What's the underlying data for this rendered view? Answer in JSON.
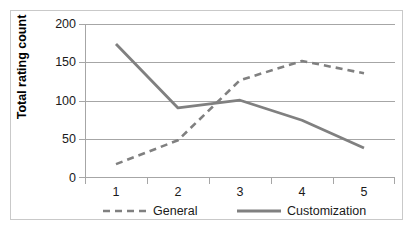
{
  "chart_data": {
    "type": "line",
    "title": "",
    "xlabel": "",
    "ylabel": "Total rating count",
    "categories": [
      "1",
      "2",
      "3",
      "4",
      "5"
    ],
    "ylim": [
      0,
      200
    ],
    "yticks": [
      0,
      50,
      100,
      150,
      200
    ],
    "grid": true,
    "legend_position": "bottom",
    "series": [
      {
        "name": "General",
        "style": "dashed",
        "color": "#808080",
        "values": [
          18,
          49,
          127,
          152,
          136
        ]
      },
      {
        "name": "Customization",
        "style": "solid",
        "color": "#808080",
        "values": [
          174,
          91,
          101,
          75,
          39
        ]
      }
    ]
  },
  "axis": {
    "y_title": "Total rating count",
    "y_tick_labels": [
      "200",
      "150",
      "100",
      "50",
      "0"
    ],
    "x_tick_labels": [
      "1",
      "2",
      "3",
      "4",
      "5"
    ]
  },
  "legend": {
    "items": [
      {
        "label": "General"
      },
      {
        "label": "Customization"
      }
    ]
  },
  "colors": {
    "series_general": "#808080",
    "series_customization": "#808080",
    "gridline": "#a6a6a6",
    "axis": "#a6a6a6",
    "frame": "#c9c9c9",
    "text": "#1a1a1a"
  }
}
